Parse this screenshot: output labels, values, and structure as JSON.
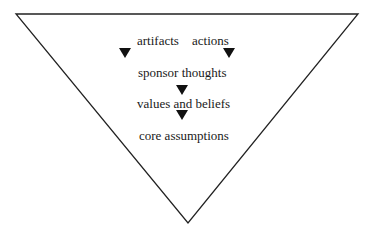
{
  "diagram": {
    "shape": "inverted-triangle",
    "colors": {
      "stroke": "#222222",
      "arrow": "#111111",
      "text": "#1a1a1a",
      "background": "#ffffff"
    },
    "labels": {
      "artifacts": "artifacts",
      "actions": "actions",
      "sponsor_thoughts": "sponsor thoughts",
      "values_beliefs": "values and beliefs",
      "core_assumptions": "core assumptions"
    },
    "arrows": [
      {
        "from": "artifacts",
        "to": "sponsor thoughts"
      },
      {
        "from": "actions",
        "to": "sponsor thoughts"
      },
      {
        "from": "sponsor thoughts",
        "to": "values and beliefs"
      },
      {
        "from": "values and beliefs",
        "to": "core assumptions"
      }
    ]
  }
}
